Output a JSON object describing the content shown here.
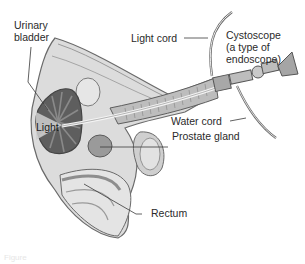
{
  "diagram": {
    "labels": {
      "urinary_bladder": "Urinary\nbladder",
      "urinary_bladder_line1": "Urinary",
      "urinary_bladder_line2": "bladder",
      "light": "Light",
      "light_cord": "Light cord",
      "cystoscope_line1": "Cystoscope",
      "cystoscope_line2": "(a type of",
      "cystoscope_line3": "endoscope)",
      "water_cord": "Water cord",
      "prostate_gland": "Prostate gland",
      "rectum": "Rectum"
    },
    "caption_faint": "Figure",
    "colors": {
      "background": "#ffffff",
      "tissue_light": "#d9d9d9",
      "tissue_mid": "#b3b3b3",
      "tissue_dark": "#6e6e6e",
      "outline": "#5a5a5a",
      "label_text": "#2a2a2a",
      "leader_line": "#3a3a3a"
    }
  }
}
